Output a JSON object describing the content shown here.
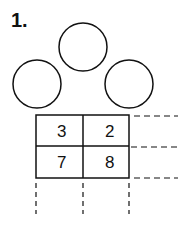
{
  "problem": {
    "number_label": "1."
  },
  "circles": [
    {
      "id": "top",
      "value": ""
    },
    {
      "id": "left",
      "value": ""
    },
    {
      "id": "right",
      "value": ""
    }
  ],
  "grid": {
    "rows": [
      [
        "3",
        "2"
      ],
      [
        "7",
        "8"
      ]
    ]
  },
  "colors": {
    "stroke": "#111111",
    "background": "#ffffff"
  }
}
